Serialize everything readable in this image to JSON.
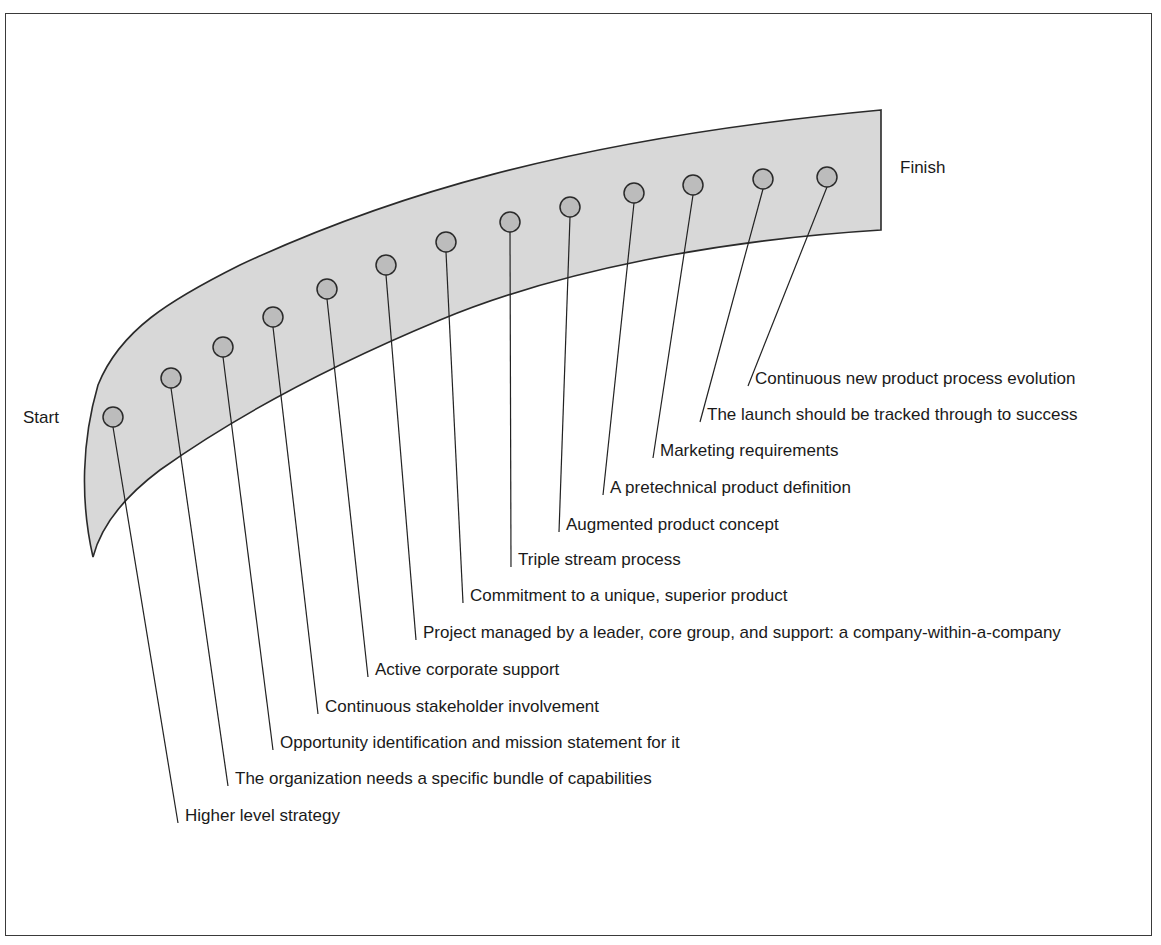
{
  "diagram": {
    "start_label": "Start",
    "finish_label": "Finish",
    "colors": {
      "band_fill": "#d8d8d8",
      "node_fill": "#bcbcbc",
      "stroke": "#2a2a2a"
    },
    "milestones": [
      {
        "label": "Higher level strategy",
        "node": [
          113,
          417
        ],
        "end": [
          178,
          823
        ]
      },
      {
        "label": "The organization needs a specific bundle of capabilities",
        "node": [
          171,
          378
        ],
        "end": [
          228,
          786
        ]
      },
      {
        "label": "Opportunity identification and mission statement for it",
        "node": [
          223,
          347
        ],
        "end": [
          273,
          750
        ]
      },
      {
        "label": "Continuous stakeholder involvement",
        "node": [
          273,
          317
        ],
        "end": [
          318,
          714
        ]
      },
      {
        "label": "Active corporate support",
        "node": [
          327,
          289
        ],
        "end": [
          368,
          677
        ]
      },
      {
        "label": "Project managed by a leader, core group, and support: a company-within-a-company",
        "node": [
          386,
          265
        ],
        "end": [
          416,
          640
        ]
      },
      {
        "label": "Commitment to a unique, superior product",
        "node": [
          446,
          242
        ],
        "end": [
          463,
          603
        ]
      },
      {
        "label": "Triple stream process",
        "node": [
          510,
          222
        ],
        "end": [
          511,
          567
        ]
      },
      {
        "label": "Augmented product concept",
        "node": [
          570,
          207
        ],
        "end": [
          559,
          532
        ]
      },
      {
        "label": "A pretechnical product definition",
        "node": [
          634,
          193
        ],
        "end": [
          603,
          495
        ]
      },
      {
        "label": "Marketing requirements",
        "node": [
          693,
          185
        ],
        "end": [
          653,
          458
        ]
      },
      {
        "label": "The launch should be tracked through to success",
        "node": [
          763,
          179
        ],
        "end": [
          700,
          422
        ]
      },
      {
        "label": "Continuous new product process evolution",
        "node": [
          827,
          177
        ],
        "end": [
          748,
          386
        ]
      }
    ]
  }
}
